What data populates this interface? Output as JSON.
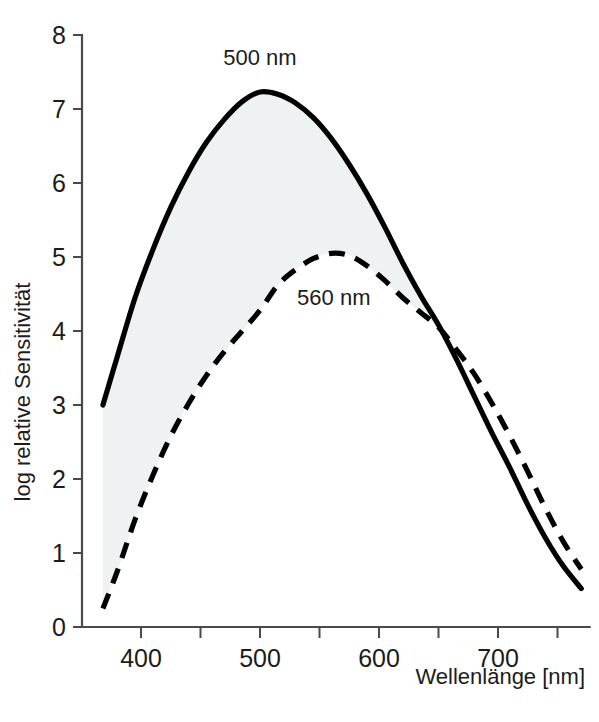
{
  "chart_data": {
    "type": "line",
    "title": "",
    "xlabel": "Wellenlänge   [nm]",
    "ylabel": "log relative Sensitivität",
    "xlim": [
      360,
      775
    ],
    "ylim": [
      0,
      8
    ],
    "grid": false,
    "legend_position": "inline-annotations",
    "x_ticks_major": [
      400,
      500,
      600,
      700
    ],
    "x_ticks_major_labels": [
      "400",
      "500",
      "600",
      "700"
    ],
    "x_ticks_minor": [
      450,
      550,
      650,
      750
    ],
    "y_ticks": [
      0,
      1,
      2,
      3,
      4,
      5,
      6,
      7,
      8
    ],
    "y_tick_labels": [
      "0",
      "1",
      "2",
      "3",
      "4",
      "5",
      "6",
      "7",
      "8"
    ],
    "shaded_band": {
      "between": [
        "500 nm",
        "560 nm"
      ],
      "color": "#eff2f2",
      "description": "light grey area between the two curves from 368 nm to the 650 nm crossover"
    },
    "annotations": [
      {
        "text": "500 nm",
        "x": 500,
        "y": 7.6,
        "series": "500 nm"
      },
      {
        "text": "560 nm",
        "x": 562,
        "y": 4.35,
        "series": "560 nm"
      }
    ],
    "series": [
      {
        "name": "500 nm",
        "style": "solid",
        "color": "#000000",
        "peak_x": 500,
        "peak_y": 7.23,
        "x": [
          368,
          380,
          395,
          410,
          425,
          440,
          455,
          470,
          485,
          500,
          515,
          530,
          545,
          560,
          575,
          590,
          605,
          620,
          635,
          650,
          665,
          680,
          695,
          710,
          725,
          740,
          755,
          770
        ],
        "y": [
          3.0,
          3.65,
          4.45,
          5.1,
          5.67,
          6.15,
          6.55,
          6.86,
          7.1,
          7.23,
          7.2,
          7.08,
          6.88,
          6.6,
          6.25,
          5.85,
          5.4,
          4.92,
          4.48,
          4.08,
          3.62,
          3.12,
          2.62,
          2.15,
          1.65,
          1.2,
          0.82,
          0.52
        ]
      },
      {
        "name": "560 nm",
        "style": "dashed",
        "color": "#000000",
        "peak_x": 562,
        "peak_y": 5.05,
        "x": [
          368,
          380,
          395,
          410,
          425,
          440,
          455,
          470,
          485,
          500,
          515,
          530,
          545,
          560,
          575,
          590,
          605,
          620,
          635,
          650,
          665,
          680,
          695,
          710,
          725,
          740,
          755,
          770
        ],
        "y": [
          0.25,
          0.75,
          1.45,
          2.05,
          2.58,
          3.02,
          3.4,
          3.72,
          4.0,
          4.28,
          4.62,
          4.83,
          4.98,
          5.05,
          5.02,
          4.88,
          4.68,
          4.45,
          4.25,
          4.05,
          3.75,
          3.42,
          3.02,
          2.58,
          2.1,
          1.6,
          1.15,
          0.78
        ]
      }
    ]
  },
  "axes": {
    "x_axis_title": "Wellenlänge   [nm]",
    "y_axis_title": "log relative Sensitivität"
  },
  "figure": {
    "background_color": "#ffffff",
    "axis_color": "#4a4a4a",
    "curve_color": "#000000",
    "band_color": "#eff2f2"
  }
}
